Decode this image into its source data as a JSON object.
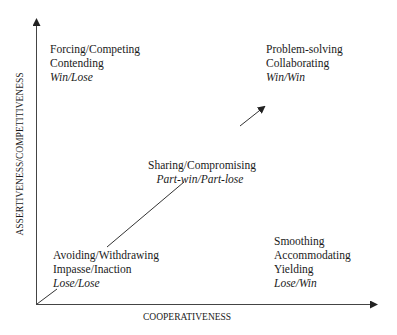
{
  "axes": {
    "x_label": "COOPERATIVENESS",
    "y_label": "ASSERTIVENESS/COMPETITIVENESS"
  },
  "quadrants": {
    "top_left": {
      "lines": [
        "Forcing/Competing",
        "Contending"
      ],
      "outcome": "Win/Lose"
    },
    "top_right": {
      "lines": [
        "Problem-solving",
        "Collaborating"
      ],
      "outcome": "Win/Win"
    },
    "center": {
      "lines": [
        "Sharing/Compromising"
      ],
      "outcome": "Part-win/Part-lose"
    },
    "bottom_left": {
      "lines": [
        "Avoiding/Withdrawing",
        "Impasse/Inaction"
      ],
      "outcome": "Lose/Lose"
    },
    "bottom_right": {
      "lines": [
        "Smoothing",
        "Accommodating",
        "Yielding"
      ],
      "outcome": "Lose/Win"
    }
  },
  "colors": {
    "axis": "#333333",
    "text": "#1a1a1a",
    "background": "#ffffff"
  }
}
